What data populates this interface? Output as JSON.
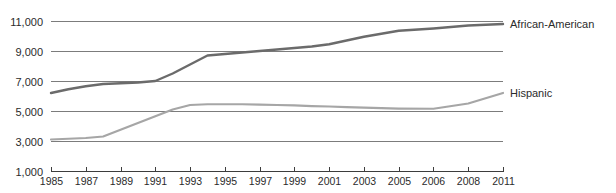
{
  "chart_data": {
    "type": "line",
    "title": "",
    "subtitle": "",
    "xlabel": "",
    "ylabel": "",
    "grid": "horizontal",
    "legend_position": "right-inline",
    "xlim": [
      1985,
      2011
    ],
    "ylim": [
      1000,
      11000
    ],
    "y_ticks": [
      "1,000",
      "3,000",
      "5,000",
      "7,000",
      "9,000",
      "11,000"
    ],
    "y_tick_values": [
      1000,
      3000,
      5000,
      7000,
      9000,
      11000
    ],
    "x_ticks": [
      "1985",
      "1987",
      "1989",
      "1991",
      "1993",
      "1995",
      "1997",
      "1999",
      "2001",
      "2003",
      "2005",
      "2006",
      "2008",
      "2011"
    ],
    "x_tick_values": [
      1985,
      1987,
      1989,
      1991,
      1993,
      1995,
      1997,
      1999,
      2001,
      2003,
      2005,
      2006,
      2008,
      2011
    ],
    "series": [
      {
        "name": "African-American",
        "color": "#6b6b6b",
        "label_x": 2011,
        "label_y": 10800,
        "x": [
          1985,
          1986,
          1987,
          1988,
          1989,
          1990,
          1991,
          1992,
          1993,
          1994,
          1995,
          1996,
          1997,
          1998,
          1999,
          2000,
          2001,
          2002,
          2003,
          2004,
          2005,
          2006,
          2008,
          2011
        ],
        "values": [
          6200,
          6450,
          6650,
          6800,
          6850,
          6900,
          7000,
          7500,
          8100,
          8700,
          8800,
          8900,
          9000,
          9100,
          9200,
          9300,
          9450,
          9700,
          9950,
          10150,
          10350,
          10500,
          10700,
          10800
        ]
      },
      {
        "name": "Hispanic",
        "color": "#a6a6a6",
        "label_x": 2011,
        "label_y": 6200,
        "x": [
          1985,
          1986,
          1987,
          1988,
          1989,
          1990,
          1991,
          1992,
          1993,
          1994,
          1995,
          1996,
          1997,
          1998,
          1999,
          2000,
          2001,
          2002,
          2003,
          2004,
          2005,
          2006,
          2008,
          2011
        ],
        "values": [
          3100,
          3150,
          3200,
          3300,
          3750,
          4200,
          4650,
          5100,
          5400,
          5450,
          5450,
          5450,
          5430,
          5400,
          5370,
          5330,
          5300,
          5260,
          5220,
          5190,
          5160,
          5150,
          5500,
          6200
        ]
      }
    ]
  },
  "axes": {
    "y_axis_name": "population-axis",
    "x_axis_name": "year-axis"
  }
}
